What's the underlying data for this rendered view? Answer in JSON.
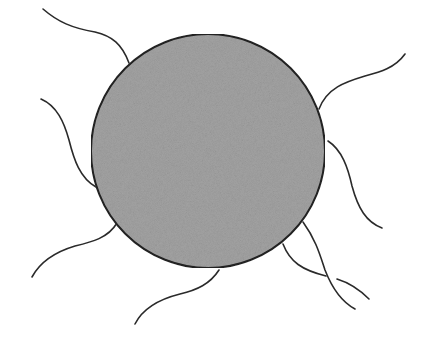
{
  "figure": {
    "description": "Gray filled sphere with wavy strands (flagella-like tails) radiating from its surface",
    "background_color": "#ffffff",
    "body": {
      "shape": "circle",
      "cx": 208,
      "cy": 151,
      "r": 117,
      "fill_color": "#a3a3a3",
      "stroke_color": "#222222"
    },
    "strand_color": "#2a2a2a",
    "strand_count": 9
  }
}
